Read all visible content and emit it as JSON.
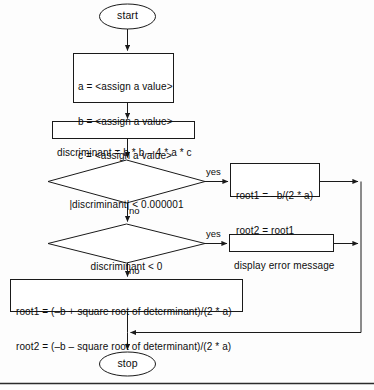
{
  "diagram": {
    "type": "flowchart",
    "colors": {
      "stroke": "#1a1a1a",
      "fill": "#ffffff",
      "text": "#0d0d0d",
      "background": "#fdfdfd",
      "rule": "#2b2b2b"
    }
  },
  "nodes": {
    "start": {
      "shape": "terminal",
      "label": "start"
    },
    "assign": {
      "shape": "process",
      "lines": [
        "a = <assign a value>",
        "b = <assign a value>",
        "c = <assign a value>"
      ]
    },
    "discriminant": {
      "shape": "process",
      "lines": [
        "discriminant = b * b – 4 * a * c"
      ]
    },
    "decision_zero": {
      "shape": "decision",
      "lines": [
        "|discriminant| < 0.000001"
      ]
    },
    "double_root": {
      "shape": "process",
      "lines": [
        "root1 = –b/(2 * a)",
        "root2 = root1"
      ]
    },
    "decision_negative": {
      "shape": "decision",
      "lines": [
        "discriminant < 0"
      ]
    },
    "error": {
      "shape": "process",
      "lines": [
        "display error message"
      ]
    },
    "two_roots": {
      "shape": "process",
      "lines": [
        "root1 = (–b + square root of determinant)/(2 * a)",
        "root2 = (–b – square root of determinant)/(2 * a)"
      ]
    },
    "stop": {
      "shape": "terminal",
      "label": "stop"
    }
  },
  "edge_labels": {
    "zero_yes": "yes",
    "zero_no": "no",
    "negative_yes": "yes",
    "negative_no": "no"
  }
}
